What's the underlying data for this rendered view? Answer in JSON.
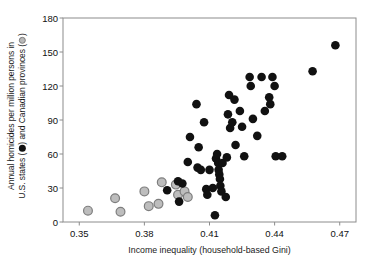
{
  "chart_data": {
    "type": "scatter",
    "title": "",
    "xlabel": "Income inequality (household-based Gini)",
    "ylabel_line1": "Annual homicides per million persons in",
    "ylabel_line2_pre": "U.S. states (",
    "ylabel_line2_mid": ") and Canadian provinces (",
    "ylabel_line2_post": ")",
    "ylabel_full": "Annual homicides per million persons in U.S. states (●) and Canadian provinces (◉)",
    "xlim": [
      0.3425,
      0.4775
    ],
    "ylim": [
      0,
      180
    ],
    "xticks": [
      0.35,
      0.38,
      0.41,
      0.44,
      0.47
    ],
    "xticklabels": [
      "0.35",
      "0.38",
      "0.41",
      "0.44",
      "0.47"
    ],
    "yticks": [
      0,
      30,
      60,
      90,
      120,
      150,
      180
    ],
    "yticklabels": [
      "0",
      "30",
      "60",
      "90",
      "120",
      "150",
      "180"
    ],
    "grid": false,
    "legend_position": "in-axis-label",
    "marker_size": 7,
    "series": [
      {
        "name": "U.S. states",
        "marker": "filled-circle-black",
        "color": "#111111",
        "edge_color": "#111111",
        "points": [
          [
            0.3905,
            28
          ],
          [
            0.3955,
            36
          ],
          [
            0.396,
            18
          ],
          [
            0.3975,
            34
          ],
          [
            0.4,
            53
          ],
          [
            0.401,
            75
          ],
          [
            0.404,
            104
          ],
          [
            0.4045,
            48
          ],
          [
            0.405,
            66
          ],
          [
            0.406,
            46
          ],
          [
            0.4075,
            88
          ],
          [
            0.4085,
            29
          ],
          [
            0.409,
            24
          ],
          [
            0.41,
            46
          ],
          [
            0.4115,
            30
          ],
          [
            0.4125,
            6
          ],
          [
            0.413,
            56
          ],
          [
            0.4135,
            60
          ],
          [
            0.414,
            52
          ],
          [
            0.4142,
            46
          ],
          [
            0.4145,
            42
          ],
          [
            0.4148,
            38
          ],
          [
            0.415,
            32
          ],
          [
            0.4155,
            27
          ],
          [
            0.416,
            52
          ],
          [
            0.4175,
            22
          ],
          [
            0.418,
            57
          ],
          [
            0.4185,
            95
          ],
          [
            0.419,
            112
          ],
          [
            0.4195,
            83
          ],
          [
            0.4205,
            88
          ],
          [
            0.4215,
            108
          ],
          [
            0.422,
            68
          ],
          [
            0.424,
            98
          ],
          [
            0.425,
            84
          ],
          [
            0.426,
            58
          ],
          [
            0.4285,
            128
          ],
          [
            0.429,
            120
          ],
          [
            0.43,
            91
          ],
          [
            0.432,
            76
          ],
          [
            0.434,
            128
          ],
          [
            0.4355,
            98
          ],
          [
            0.4375,
            110
          ],
          [
            0.438,
            104
          ],
          [
            0.439,
            128
          ],
          [
            0.44,
            120
          ],
          [
            0.4405,
            58
          ],
          [
            0.4435,
            58
          ],
          [
            0.4575,
            133
          ],
          [
            0.468,
            156
          ]
        ]
      },
      {
        "name": "Canadian provinces",
        "marker": "filled-circle-gray",
        "color": "#bdbdbd",
        "edge_color": "#7d7d7d",
        "points": [
          [
            0.354,
            10
          ],
          [
            0.3665,
            21
          ],
          [
            0.369,
            9
          ],
          [
            0.38,
            27
          ],
          [
            0.382,
            14
          ],
          [
            0.3865,
            16
          ],
          [
            0.388,
            35
          ],
          [
            0.3945,
            33
          ],
          [
            0.3955,
            24
          ],
          [
            0.3985,
            27
          ],
          [
            0.4,
            22
          ]
        ]
      }
    ]
  },
  "axes_geometry": {
    "left_px": 63,
    "right_px": 356,
    "top_px": 18,
    "bottom_px": 222
  }
}
